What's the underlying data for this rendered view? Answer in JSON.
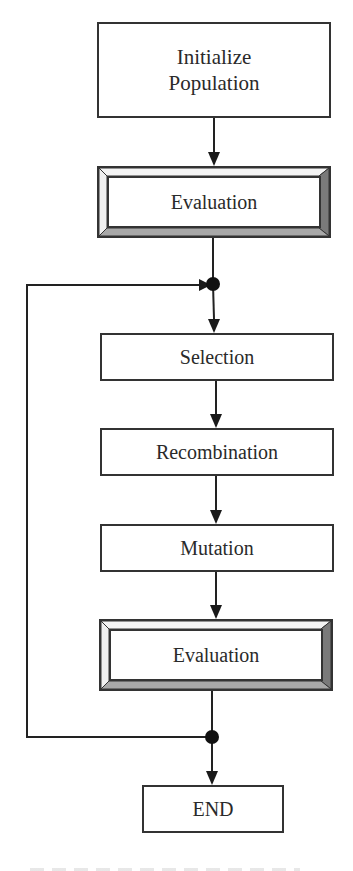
{
  "diagram": {
    "type": "flowchart",
    "nodes": [
      {
        "id": "init",
        "label_line1": "Initialize",
        "label_line2": "Population",
        "style": "plain"
      },
      {
        "id": "eval1",
        "label": "Evaluation",
        "style": "beveled"
      },
      {
        "id": "selection",
        "label": "Selection",
        "style": "plain"
      },
      {
        "id": "recombination",
        "label": "Recombination",
        "style": "plain"
      },
      {
        "id": "mutation",
        "label": "Mutation",
        "style": "plain"
      },
      {
        "id": "eval2",
        "label": "Evaluation",
        "style": "beveled"
      },
      {
        "id": "end",
        "label": "END",
        "style": "plain"
      }
    ],
    "edges": [
      {
        "from": "init",
        "to": "eval1"
      },
      {
        "from": "eval1",
        "to": "junction_top"
      },
      {
        "from": "junction_top",
        "to": "selection"
      },
      {
        "from": "selection",
        "to": "recombination"
      },
      {
        "from": "recombination",
        "to": "mutation"
      },
      {
        "from": "mutation",
        "to": "eval2"
      },
      {
        "from": "eval2",
        "to": "junction_bottom"
      },
      {
        "from": "junction_bottom",
        "to": "end"
      },
      {
        "from": "junction_bottom",
        "to": "junction_top",
        "type": "loop-back"
      }
    ],
    "colors": {
      "stroke": "#222222",
      "text": "#2a2a2a",
      "bevel_light": "#f2f2f2",
      "bevel_right": "#7a7a7a",
      "bevel_bottom": "#a8a8a8",
      "background": "#ffffff"
    }
  }
}
